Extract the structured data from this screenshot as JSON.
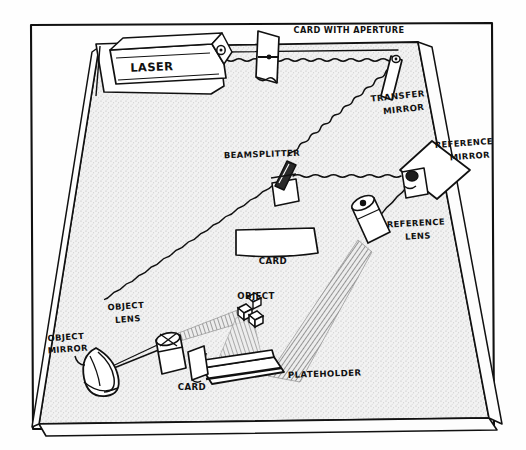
{
  "figure": {
    "medium": "pen-and-ink line drawing with stipple shading",
    "frame": {
      "border_color": "#111111",
      "background_color": "#fefefe"
    },
    "table": {
      "name": "optical-table",
      "surface_fill": "#efefef",
      "surface_description": "stippled trapezoidal tabletop seen in perspective",
      "edge_color": "#111111"
    }
  },
  "palette": {
    "ink": "#111111",
    "paper": "#fefefe",
    "table_surface": "#eeeeee",
    "stipple": "#bbbbbb",
    "component_fill": "#ffffff",
    "beam": "#111111",
    "light_cone": "#8a8a8a"
  },
  "labels": [
    {
      "id": "laser",
      "text": "LASER",
      "x": 152,
      "y": 71,
      "size": 11.5,
      "rotate": -2
    },
    {
      "id": "card-with-aperture",
      "text": "CARD WITH APERTURE",
      "x": 349,
      "y": 33,
      "size": 8.2,
      "rotate": 0
    },
    {
      "id": "transfer-mirror-1",
      "text": "TRANSFER",
      "x": 398,
      "y": 99,
      "size": 8.6,
      "rotate": -6
    },
    {
      "id": "transfer-mirror-2",
      "text": "MIRROR",
      "x": 404,
      "y": 112,
      "size": 8.6,
      "rotate": -6
    },
    {
      "id": "reference-mirror-1",
      "text": "REFERENCE",
      "x": 464,
      "y": 146,
      "size": 8.4,
      "rotate": -4
    },
    {
      "id": "reference-mirror-2",
      "text": "MIRROR",
      "x": 470,
      "y": 159,
      "size": 8.4,
      "rotate": -4
    },
    {
      "id": "beamsplitter",
      "text": "BEAMSPLITTER",
      "x": 262,
      "y": 157,
      "size": 8.4,
      "rotate": -2
    },
    {
      "id": "reference-lens-1",
      "text": "REFERENCE",
      "x": 416,
      "y": 226,
      "size": 8.4,
      "rotate": -3
    },
    {
      "id": "reference-lens-2",
      "text": "LENS",
      "x": 418,
      "y": 239,
      "size": 8.4,
      "rotate": -3
    },
    {
      "id": "card-centre",
      "text": "CARD",
      "x": 273,
      "y": 264,
      "size": 8.6,
      "rotate": 0
    },
    {
      "id": "object",
      "text": "OBJECT",
      "x": 256,
      "y": 299,
      "size": 8.6,
      "rotate": 0
    },
    {
      "id": "object-lens-1",
      "text": "OBJECT",
      "x": 126,
      "y": 309,
      "size": 8.4,
      "rotate": -4
    },
    {
      "id": "object-lens-2",
      "text": "LENS",
      "x": 128,
      "y": 322,
      "size": 8.4,
      "rotate": -4
    },
    {
      "id": "object-mirror-1",
      "text": "OBJECT",
      "x": 66,
      "y": 340,
      "size": 8.4,
      "rotate": -4
    },
    {
      "id": "object-mirror-2",
      "text": "MIRROR",
      "x": 68,
      "y": 352,
      "size": 8.4,
      "rotate": -4
    },
    {
      "id": "card-lower",
      "text": "CARD",
      "x": 192,
      "y": 390,
      "size": 8.6,
      "rotate": 0
    },
    {
      "id": "plateholder",
      "text": "PLATEHOLDER",
      "x": 288,
      "y": 378,
      "size": 8.6,
      "rotate": -2
    }
  ],
  "components": [
    {
      "id": "laser",
      "label": "LASER",
      "kind": "source",
      "note": "long box laser on a raised stand at the back-left of the table"
    },
    {
      "id": "card-with-aperture",
      "label": "CARD WITH APERTURE",
      "kind": "aperture",
      "note": "upright card with a pinhole the beam passes through"
    },
    {
      "id": "transfer-mirror",
      "label": "TRANSFER MIRROR",
      "kind": "mirror",
      "note": "narrow mirror at the far right corner, turns the beam toward the beamsplitter"
    },
    {
      "id": "beamsplitter",
      "label": "BEAMSPLITTER",
      "kind": "beamsplitter",
      "note": "splits the beam into object and reference paths"
    },
    {
      "id": "reference-mirror",
      "label": "REFERENCE MIRROR",
      "kind": "mirror",
      "note": "diamond-shaped mirror on the right side"
    },
    {
      "id": "reference-lens",
      "label": "REFERENCE LENS",
      "kind": "lens",
      "note": "spreads the reference beam over the plateholder"
    },
    {
      "id": "object-mirror",
      "label": "OBJECT MIRROR",
      "kind": "mirror",
      "note": "mirror at the bottom-left corner, folds the object beam"
    },
    {
      "id": "object-lens",
      "label": "OBJECT LENS",
      "kind": "lens",
      "note": "spreads the object beam onto the object"
    },
    {
      "id": "object",
      "label": "OBJECT",
      "kind": "subject",
      "note": "small cluster of cubes being recorded"
    },
    {
      "id": "plateholder",
      "label": "PLATEHOLDER",
      "kind": "holder",
      "note": "holds the holographic plate at the bottom centre"
    },
    {
      "id": "card-centre",
      "label": "CARD",
      "kind": "card",
      "note": "flat card lying on the table near the beamsplitter"
    },
    {
      "id": "card-lower",
      "label": "CARD",
      "kind": "card",
      "note": "small upright card beside the plateholder"
    }
  ],
  "beam_paths": [
    {
      "id": "laser-to-aperture",
      "from": "laser",
      "to": "card-with-aperture",
      "style": "wavy"
    },
    {
      "id": "aperture-to-transfer",
      "from": "card-with-aperture",
      "to": "transfer-mirror",
      "style": "wavy"
    },
    {
      "id": "transfer-to-beamsplitter",
      "from": "transfer-mirror",
      "to": "beamsplitter",
      "style": "wavy"
    },
    {
      "id": "beamsplitter-to-reference",
      "from": "beamsplitter",
      "to": "reference-mirror",
      "style": "wavy"
    },
    {
      "id": "reference-to-reference-lens",
      "from": "reference-mirror",
      "to": "reference-lens",
      "style": "wavy"
    },
    {
      "id": "beamsplitter-to-object-mirror",
      "from": "beamsplitter",
      "to": "object-mirror",
      "style": "wavy"
    },
    {
      "id": "object-mirror-to-object-lens",
      "from": "object-mirror",
      "to": "object-lens",
      "style": "straight"
    }
  ],
  "light_cones": [
    {
      "id": "reference-cone",
      "from": "reference-lens",
      "to": "plateholder",
      "style": "hatched"
    },
    {
      "id": "object-cone",
      "from": "object-lens",
      "to": "object",
      "style": "hatched"
    },
    {
      "id": "object-to-plate",
      "from": "object",
      "to": "plateholder",
      "style": "hatched"
    }
  ]
}
